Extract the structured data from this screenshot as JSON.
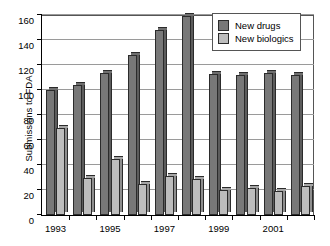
{
  "chart_data": {
    "type": "bar",
    "title": "",
    "xlabel": "",
    "ylabel": "Submissions to FDA",
    "ylim": [
      0,
      160
    ],
    "ytick_values": [
      0,
      20,
      40,
      60,
      80,
      100,
      120,
      140,
      160
    ],
    "ytick_labels": [
      "0",
      "20",
      "40",
      "60",
      "80",
      "100",
      "120",
      "140",
      "160"
    ],
    "grid": true,
    "legend_position": "top-right",
    "categories": [
      1993,
      1994,
      1995,
      1996,
      1997,
      1998,
      1999,
      2000,
      2001,
      2002
    ],
    "xtick_labels": [
      "1993",
      "1995",
      "1997",
      "1999",
      "2001"
    ],
    "xtick_label_categories": [
      1993,
      1995,
      1997,
      1999,
      2001
    ],
    "series": [
      {
        "name": "New drugs",
        "color": "#787878",
        "values": [
          100,
          104,
          114,
          128,
          148,
          159,
          113,
          112,
          114,
          112
        ]
      },
      {
        "name": "New biologics",
        "color": "#bdbdbd",
        "values": [
          70,
          30,
          45,
          25,
          31,
          29,
          20,
          22,
          19,
          23
        ]
      }
    ]
  },
  "legend": {
    "items": [
      {
        "label": "New drugs",
        "swatch": "#787878"
      },
      {
        "label": "New biologics",
        "swatch": "#bdbdbd"
      }
    ]
  }
}
